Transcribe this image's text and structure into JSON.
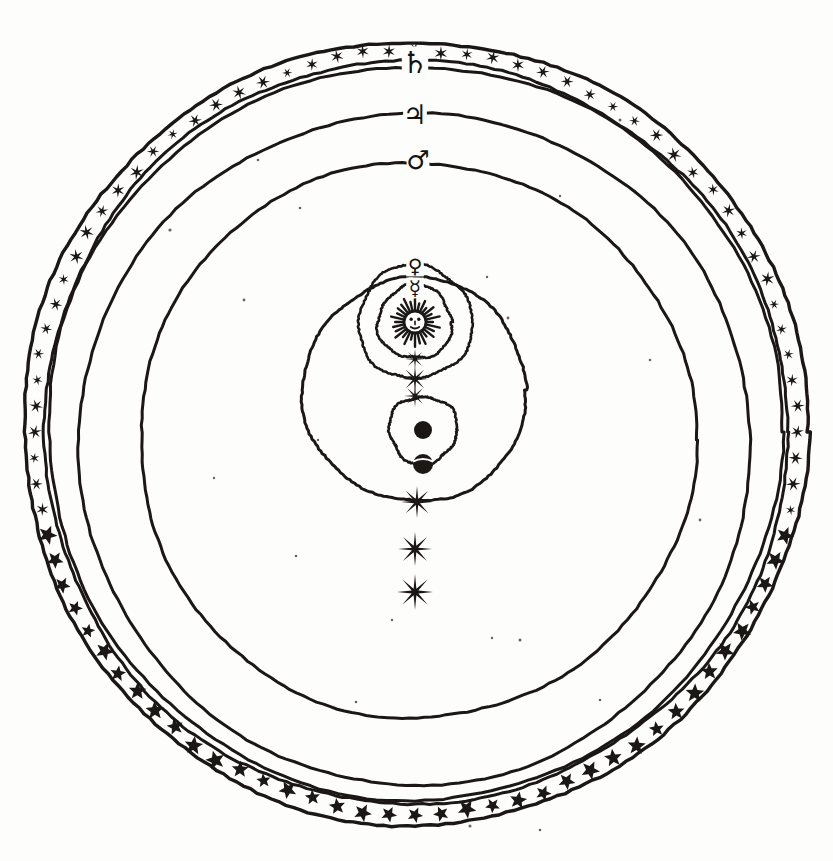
{
  "figure": {
    "name": "tychonic-geo-heliocentric-system",
    "medium": "engraving",
    "ink_color": "#1a1714",
    "paper_color": "#fdfdfc",
    "width": 833,
    "height": 861
  },
  "geometry": {
    "sphere_center": {
      "x": 415,
      "y": 432
    },
    "stellar_band": {
      "outer_radius": 392,
      "inner_radius": 372
    },
    "sun_center": {
      "x": 415,
      "y": 322
    },
    "earth_center": {
      "x": 423,
      "y": 430
    }
  },
  "stellar_band": {
    "label": "sphere of the fixed stars",
    "star_count": 92,
    "star_points_upper": 6,
    "star_points_lower": 5
  },
  "orbits": [
    {
      "id": "saturn",
      "label": "Saturn",
      "glyph": "♄",
      "glyph_name": "saturn-symbol",
      "center": {
        "x": 415,
        "y": 432
      },
      "radius": 367,
      "marker_angle_deg": -90,
      "node_marker": "none"
    },
    {
      "id": "jupiter",
      "label": "Jupiter",
      "glyph": "♃",
      "glyph_name": "jupiter-symbol",
      "center": {
        "x": 415,
        "y": 448
      },
      "radius": 336,
      "marker_angle_deg": -90,
      "node_marker": "star-8"
    },
    {
      "id": "mars",
      "label": "Mars",
      "glyph": "♂",
      "glyph_name": "mars-symbol",
      "center": {
        "x": 417,
        "y": 440
      },
      "radius": 278,
      "marker_angle_deg": -90,
      "node_marker": "star-8"
    },
    {
      "id": "sun-annual",
      "label": "Sun's annual orbit about the Earth",
      "glyph": "",
      "glyph_name": "sun-orbit",
      "center": {
        "x": 415,
        "y": 390
      },
      "radius": 112,
      "marker_angle_deg": -90,
      "node_marker": "star-8"
    },
    {
      "id": "venus",
      "label": "Venus",
      "glyph": "♀",
      "glyph_name": "venus-symbol",
      "center": {
        "x": 415,
        "y": 322
      },
      "radius": 57,
      "marker_angle_deg": -90,
      "node_marker": "star-8"
    },
    {
      "id": "mercury",
      "label": "Mercury",
      "glyph": "☿",
      "glyph_name": "mercury-symbol",
      "center": {
        "x": 415,
        "y": 322
      },
      "radius": 37,
      "marker_angle_deg": -90,
      "node_marker": "star-8"
    },
    {
      "id": "moon",
      "label": "Moon",
      "glyph": "",
      "glyph_name": "moon-orbit",
      "center": {
        "x": 423,
        "y": 430
      },
      "radius": 34,
      "marker_angle_deg": 90,
      "node_marker": "none"
    }
  ],
  "bodies": [
    {
      "id": "sun",
      "label": "Sun",
      "glyph_name": "radiant-sun-face",
      "x": 415,
      "y": 322,
      "radius": 11,
      "rays": 28,
      "has_face": true
    },
    {
      "id": "earth",
      "label": "Earth",
      "glyph_name": "earth-disc",
      "x": 423,
      "y": 430,
      "radius": 9,
      "rays": 0,
      "has_face": false
    },
    {
      "id": "moon-body",
      "label": "Moon",
      "glyph_name": "moon-disc",
      "x": 423,
      "y": 464,
      "radius": 10,
      "rays": 0,
      "has_face": false
    }
  ],
  "node_stars": [
    {
      "id": "node-venus",
      "x": 415,
      "y": 379,
      "points": 8,
      "radius": 13
    },
    {
      "id": "node-mercury",
      "x": 415,
      "y": 359,
      "points": 8,
      "radius": 10
    },
    {
      "id": "node-sun",
      "x": 415,
      "y": 396,
      "points": 8,
      "radius": 11
    },
    {
      "id": "node-mars",
      "x": 417,
      "y": 502,
      "points": 8,
      "radius": 16
    },
    {
      "id": "node-jupiter",
      "x": 415,
      "y": 549,
      "points": 8,
      "radius": 17
    },
    {
      "id": "node-saturn",
      "x": 415,
      "y": 592,
      "points": 8,
      "radius": 18
    }
  ],
  "glyph_markers": [
    {
      "id": "marker-saturn",
      "glyph": "♄",
      "x": 415,
      "y": 62,
      "size": 30
    },
    {
      "id": "marker-jupiter",
      "glyph": "♃",
      "x": 415,
      "y": 114,
      "size": 27
    },
    {
      "id": "marker-mars",
      "glyph": "♂",
      "x": 418,
      "y": 160,
      "size": 26
    },
    {
      "id": "marker-venus",
      "glyph": "♀",
      "x": 415,
      "y": 266,
      "size": 20
    },
    {
      "id": "marker-mercury",
      "glyph": "☿",
      "x": 415,
      "y": 288,
      "size": 20
    }
  ],
  "specks": [
    {
      "x": 170,
      "y": 230,
      "r": 1.6
    },
    {
      "x": 300,
      "y": 208,
      "r": 1.3
    },
    {
      "x": 620,
      "y": 120,
      "r": 1.5
    },
    {
      "x": 560,
      "y": 196,
      "r": 1.2
    },
    {
      "x": 244,
      "y": 300,
      "r": 1.4
    },
    {
      "x": 650,
      "y": 360,
      "r": 1.3
    },
    {
      "x": 508,
      "y": 318,
      "r": 1.4
    },
    {
      "x": 487,
      "y": 277,
      "r": 1.2
    },
    {
      "x": 296,
      "y": 556,
      "r": 1.3
    },
    {
      "x": 520,
      "y": 640,
      "r": 1.5
    },
    {
      "x": 356,
      "y": 702,
      "r": 1.3
    },
    {
      "x": 492,
      "y": 638,
      "r": 1.2
    },
    {
      "x": 214,
      "y": 478,
      "r": 1.2
    },
    {
      "x": 700,
      "y": 520,
      "r": 1.4
    },
    {
      "x": 470,
      "y": 826,
      "r": 1.5
    },
    {
      "x": 540,
      "y": 830,
      "r": 1.3
    },
    {
      "x": 318,
      "y": 440,
      "r": 1.2
    },
    {
      "x": 600,
      "y": 700,
      "r": 1.3
    },
    {
      "x": 392,
      "y": 620,
      "r": 1.2
    },
    {
      "x": 258,
      "y": 160,
      "r": 1.3
    }
  ]
}
